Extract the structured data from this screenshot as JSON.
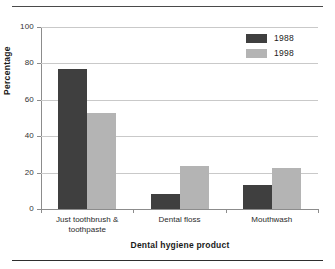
{
  "chart_data": {
    "type": "bar",
    "title": "",
    "subtitle": "",
    "xlabel": "Dental hygiene product",
    "ylabel": "Percentage",
    "categories": [
      "Just toothbrush & toothpaste",
      "Dental floss",
      "Mouthwash"
    ],
    "category_lines": [
      [
        "Just toothbrush &",
        "toothpaste"
      ],
      [
        "Dental floss"
      ],
      [
        "Mouthwash"
      ]
    ],
    "series": [
      {
        "name": "1988",
        "color": "#3f3f3f",
        "values": [
          77,
          8,
          13
        ]
      },
      {
        "name": "1998",
        "color": "#b4b4b4",
        "values": [
          52.5,
          23.5,
          22.5
        ]
      }
    ],
    "ylim": [
      0,
      100
    ],
    "yticks": [
      0,
      20,
      40,
      60,
      80,
      100
    ],
    "ytick_labels": [
      "0",
      "20",
      "40",
      "60",
      "80",
      "100"
    ],
    "grid": "horizontal",
    "legend_position": "top-right",
    "legend_entries": [
      "1988",
      "1998"
    ]
  },
  "figure": {
    "axis_color": "#8c8c8c",
    "grid_color": "#c9c9c9",
    "rule_color": "#4a4a4a",
    "background": "#ffffff"
  }
}
